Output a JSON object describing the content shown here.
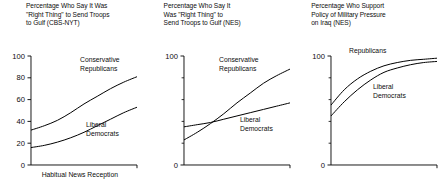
{
  "figure": {
    "background": "#ffffff",
    "line_color": "#000000",
    "text_color": "#0d0d0d"
  },
  "chart_data": [
    {
      "type": "line",
      "panel_index": 1,
      "title": "Percentage Who Say It Was\n\"Right Thing\" to Send Troops\nto Gulf (CBS-NYT)",
      "xlabel": "Habitual News Reception",
      "ylabel": "",
      "xlim": [
        0,
        100
      ],
      "ylim": [
        0,
        100
      ],
      "grid": false,
      "legend_position": "inline-annotation",
      "ytick_labels": [
        "0",
        "20",
        "40",
        "60",
        "80",
        "100"
      ],
      "ytick_values": [
        0,
        20,
        40,
        60,
        80,
        100
      ],
      "xtick_labels": [],
      "series": [
        {
          "name": "Conservative\nRepublicans",
          "label_line1": "Conservative",
          "label_line2": "Republicans",
          "x": [
            0,
            12.5,
            25,
            37.5,
            50,
            62.5,
            75,
            87.5,
            100
          ],
          "values": [
            32,
            36,
            41,
            48,
            56,
            63,
            70,
            76,
            81
          ]
        },
        {
          "name": "Liberal\nDemocrats",
          "label_line1": "Liberal",
          "label_line2": "Democrats",
          "x": [
            0,
            12.5,
            25,
            37.5,
            50,
            62.5,
            75,
            87.5,
            100
          ],
          "values": [
            16,
            18,
            21,
            25,
            30,
            36,
            42,
            48,
            53
          ]
        }
      ]
    },
    {
      "type": "line",
      "panel_index": 2,
      "title": "Percentage Who Say It\nWas \"Right Thing\"  to\nSend Troops to Gulf (NES)",
      "xlabel": "",
      "ylabel": "",
      "xlim": [
        0,
        100
      ],
      "ylim": [
        0,
        100
      ],
      "grid": false,
      "legend_position": "inline-annotation",
      "ytick_labels": [
        "0",
        "100"
      ],
      "ytick_values": [
        0,
        100
      ],
      "ytick_minor_values": [
        20,
        40,
        60,
        80
      ],
      "xtick_labels": [],
      "series": [
        {
          "name": "Conservative\nRepublicans",
          "label_line1": "Conservative",
          "label_line2": "Republicans",
          "x": [
            0,
            12.5,
            25,
            37.5,
            50,
            62.5,
            75,
            87.5,
            100
          ],
          "values": [
            23,
            30,
            38,
            47,
            57,
            66,
            75,
            82,
            88
          ]
        },
        {
          "name": "Liberal\nDemocrats",
          "label_line1": "Liberal",
          "label_line2": "Democrats",
          "x": [
            0,
            12.5,
            25,
            37.5,
            50,
            62.5,
            75,
            87.5,
            100
          ],
          "values": [
            35,
            37,
            39,
            42,
            45,
            48,
            51,
            54,
            57
          ]
        }
      ]
    },
    {
      "type": "line",
      "panel_index": 3,
      "title": "Percentage Who Support\nPolicy of Military Pressure\non Iraq (NES)",
      "xlabel": "",
      "ylabel": "",
      "xlim": [
        0,
        100
      ],
      "ylim": [
        0,
        100
      ],
      "grid": false,
      "legend_position": "inline-annotation",
      "ytick_labels": [
        "0",
        "100"
      ],
      "ytick_values": [
        0,
        100
      ],
      "ytick_minor_values": [
        20,
        40,
        60,
        80
      ],
      "xtick_labels": [],
      "series": [
        {
          "name": "Conservative\nRepublicans",
          "label_line1": "Conservative",
          "label_line2": "Republicans",
          "x": [
            0,
            12.5,
            25,
            37.5,
            50,
            62.5,
            75,
            87.5,
            100
          ],
          "values": [
            55,
            69,
            79,
            86,
            91,
            94,
            96,
            97,
            98
          ]
        },
        {
          "name": "Liberal\nDemocrats",
          "label_line1": "Liberal",
          "label_line2": "Democrats",
          "x": [
            0,
            12.5,
            25,
            37.5,
            50,
            62.5,
            75,
            87.5,
            100
          ],
          "values": [
            45,
            58,
            69,
            78,
            85,
            89,
            92,
            94,
            95
          ]
        }
      ]
    }
  ]
}
